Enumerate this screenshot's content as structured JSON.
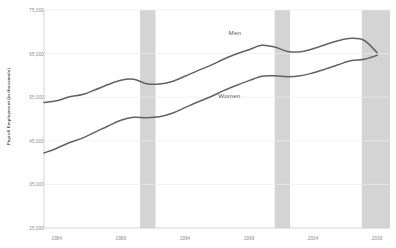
{
  "chart_data": {
    "type": "line",
    "title": "",
    "xlabel": "",
    "ylabel": "Payroll Employment (in thousands)",
    "xlim": [
      1983,
      2010
    ],
    "ylim": [
      25000,
      75000
    ],
    "grid": true,
    "legend_position": "inline-annotation",
    "yticks": [
      "75,000",
      "65,000",
      "55,000",
      "45,000",
      "35,000",
      "25,000"
    ],
    "ytick_values": [
      75000,
      65000,
      55000,
      45000,
      35000,
      25000
    ],
    "xticks": [
      "1984",
      "1989",
      "1994",
      "1999",
      "2004",
      "2009"
    ],
    "xtick_values": [
      1984,
      1989,
      1994,
      1999,
      2004,
      2009
    ],
    "x": [
      1983,
      1984,
      1985,
      1986,
      1987,
      1988,
      1989,
      1990,
      1991,
      1992,
      1993,
      1994,
      1995,
      1996,
      1997,
      1998,
      1999,
      2000,
      2001,
      2002,
      2003,
      2004,
      2005,
      2006,
      2007,
      2008,
      2009
    ],
    "series": [
      {
        "name": "Men",
        "label": "Men",
        "color": "#636363",
        "values": [
          53800,
          54200,
          55100,
          55600,
          56700,
          57900,
          58900,
          59100,
          58100,
          58000,
          58600,
          59800,
          61100,
          62300,
          63700,
          64900,
          65900,
          66900,
          66500,
          65500,
          65400,
          66100,
          67100,
          68000,
          68500,
          68000,
          65200
        ]
      },
      {
        "name": "Women",
        "label": "Women",
        "color": "#636363",
        "values": [
          42200,
          43300,
          44600,
          45600,
          47000,
          48400,
          49700,
          50400,
          50300,
          50500,
          51300,
          52600,
          53900,
          55100,
          56500,
          57700,
          58800,
          59800,
          59900,
          59700,
          59900,
          60600,
          61500,
          62500,
          63400,
          63700,
          64600
        ]
      }
    ],
    "shaded_regions": [
      {
        "name": "recession-1990",
        "start": 1990.5,
        "end": 1991.7,
        "color": "#d4d4d4"
      },
      {
        "name": "recession-2001",
        "start": 2001.0,
        "end": 2002.2,
        "color": "#d4d4d4"
      },
      {
        "name": "recession-2007",
        "start": 2007.8,
        "end": 2010.0,
        "color": "#d4d4d4"
      }
    ]
  }
}
